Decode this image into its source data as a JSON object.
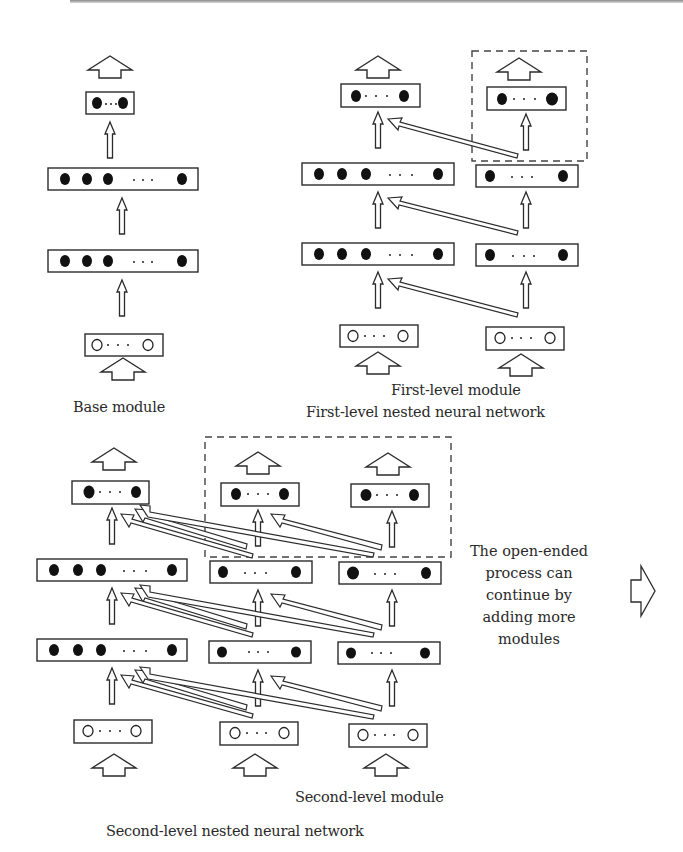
{
  "labels": {
    "base_module": "Base module",
    "first_level_module": "First-level module",
    "first_level_network": "First-level nested neural network",
    "second_level_module": "Second-level module",
    "second_level_network": "Second-level nested neural network"
  },
  "note": {
    "lines": [
      "The open-ended",
      "process can",
      "continue by",
      "adding more",
      "modules"
    ]
  },
  "colors": {
    "stroke": "#2b2b2b",
    "node_fill": "#111111",
    "dashed": "#444444",
    "background": "#ffffff"
  },
  "diagrams": {
    "base": {
      "layers": [
        {
          "x": 86,
          "y": 92,
          "w": 48,
          "h": 22,
          "type": "output",
          "filled": 1,
          "right": true
        },
        {
          "x": 48,
          "y": 168,
          "w": 150,
          "h": 22,
          "type": "hidden",
          "filled": 3,
          "right": true
        },
        {
          "x": 48,
          "y": 250,
          "w": 150,
          "h": 22,
          "type": "hidden",
          "filled": 3,
          "right": true
        },
        {
          "x": 86,
          "y": 334,
          "w": 48,
          "h": 22,
          "type": "input",
          "filled": 1,
          "right": true
        }
      ]
    }
  }
}
